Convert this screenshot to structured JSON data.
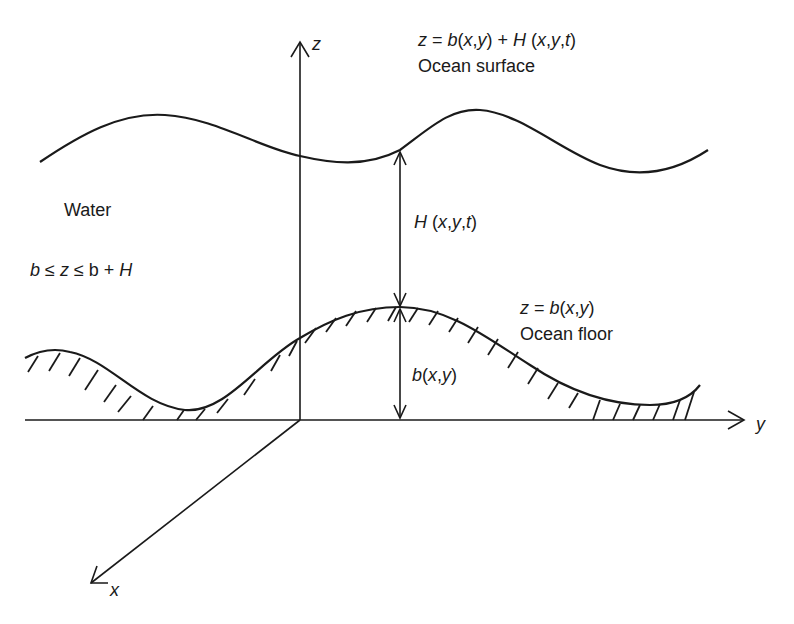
{
  "figure": {
    "type": "ocean depth schematic",
    "axes": {
      "z_label": "z",
      "y_label": "y",
      "x_label": "x"
    },
    "surface": {
      "equation_lhs": "z = ",
      "equation_b": "b",
      "equation_args1": "(x,y)",
      "equation_plus": " + ",
      "equation_H": "H",
      "equation_args2": " (x,y,t)",
      "equation_full": "z = b(x,y) + H (x,y,t)",
      "name": "Ocean surface"
    },
    "floor": {
      "equation_full": "z = b(x,y)",
      "name": "Ocean floor"
    },
    "region": {
      "name": "Water",
      "constraint": "b ≤ z ≤ b + H"
    },
    "dimensions": {
      "depth_label": "H (x,y,t)",
      "height_label": "b(x,y)"
    },
    "colors": {
      "ink": "#1a1a1a",
      "background": "#ffffff"
    }
  }
}
